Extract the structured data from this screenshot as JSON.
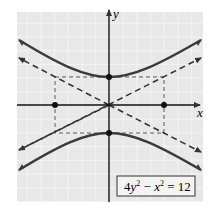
{
  "diagram": {
    "equation": "4y² − x² = 12",
    "equation_parts": {
      "a": "4",
      "y": "y",
      "sup1": "2",
      "minus": " − ",
      "x": "x",
      "sup2": "2",
      "rest": " = 12"
    },
    "axes": {
      "x_label": "x",
      "y_label": "y"
    },
    "vertices": [
      [
        0,
        1.732
      ],
      [
        0,
        -1.732
      ]
    ],
    "box_corners_on_x_axis": [
      [
        -3.464,
        0
      ],
      [
        3.464,
        0
      ]
    ],
    "asymptotes": [
      "y = x/2",
      "y = -x/2"
    ],
    "colors": {
      "grid_bg": "#e8e8e8",
      "grid_line": "#ffffff",
      "curve": "#3a3a3a",
      "axis": "#111111"
    }
  }
}
